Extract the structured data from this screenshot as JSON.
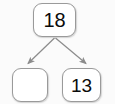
{
  "diagram": {
    "type": "number-bond-tree",
    "title": "",
    "nodes": {
      "parent": {
        "label": "18",
        "empty": false
      },
      "child_left": {
        "label": "",
        "empty": true
      },
      "child_right": {
        "label": "13",
        "empty": false
      }
    },
    "edges": [
      {
        "from": "parent",
        "to": "child_left",
        "arrowhead": "filled-triangle",
        "direction": "down-left"
      },
      {
        "from": "parent",
        "to": "child_right",
        "arrowhead": "filled-triangle",
        "direction": "down-right"
      }
    ],
    "colors": {
      "background": "#fbfbfb",
      "node_fill": "#ffffff",
      "node_border": "#9a9a9a",
      "edge": "#8c8c8c",
      "text": "#0b0b0b"
    }
  }
}
